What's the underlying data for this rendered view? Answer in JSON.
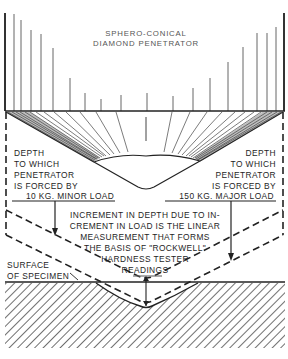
{
  "diagram": {
    "title_lines": [
      "SPHERO-CONICAL",
      "DIAMOND PENETRATOR"
    ],
    "left_label_lines": [
      "DEPTH",
      "TO WHICH",
      "PENETRATOR",
      "IS FORCED BY",
      "10 KG. MINOR LOAD"
    ],
    "right_label_lines": [
      "DEPTH",
      "TO WHICH",
      "PENETRATOR",
      "IS FORCED BY",
      "150 KG. MAJOR LOAD"
    ],
    "center_label_lines": [
      "INCREMENT IN DEPTH DUE TO IN-",
      "CREMENT IN LOAD IS THE LINEAR",
      "MEASUREMENT THAT FORMS",
      "THE BASIS OF \"ROCKWELL\"",
      "HARDNESS TESTER",
      "READINGS"
    ],
    "surface_label_lines": [
      "SURFACE",
      "OF SPECIMEN"
    ],
    "colors": {
      "ink": "#222222",
      "title_gray": "#555555",
      "background": "#ffffff"
    }
  }
}
